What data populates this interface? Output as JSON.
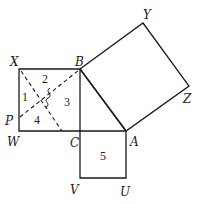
{
  "diagram": {
    "type": "pythagorean-dissection",
    "points": {
      "X": {
        "label": "X",
        "x": 19,
        "y": 69
      },
      "B": {
        "label": "B",
        "x": 80,
        "y": 69
      },
      "W": {
        "label": "W",
        "x": 19,
        "y": 131
      },
      "C": {
        "label": "C",
        "x": 80,
        "y": 131
      },
      "P": {
        "label": "P",
        "x": 19,
        "y": 118
      },
      "A": {
        "label": "A",
        "x": 126,
        "y": 131
      },
      "V": {
        "label": "V",
        "x": 80,
        "y": 178
      },
      "U": {
        "label": "U",
        "x": 126,
        "y": 178
      },
      "Y": {
        "label": "Y",
        "x": 143,
        "y": 23
      },
      "Z": {
        "label": "Z",
        "x": 189,
        "y": 86
      }
    },
    "regions": [
      {
        "label": "1"
      },
      {
        "label": "2"
      },
      {
        "label": "3"
      },
      {
        "label": "4"
      },
      {
        "label": "5"
      }
    ],
    "right_angle_mark": "ʃ"
  }
}
